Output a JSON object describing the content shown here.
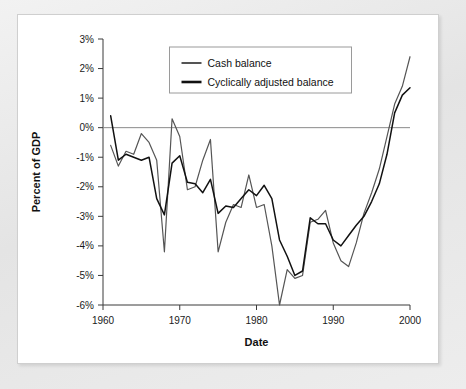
{
  "chart_data": {
    "type": "line",
    "title": "",
    "xlabel": "Date",
    "ylabel": "Percent of GDP",
    "xlim": [
      1960,
      2000
    ],
    "ylim": [
      -6,
      3
    ],
    "xticks": [
      1960,
      1970,
      1980,
      1990,
      2000
    ],
    "xtick_labels": [
      "1960",
      "1970",
      "1980",
      "1990",
      "2000"
    ],
    "yticks": [
      3,
      2,
      1,
      0,
      -1,
      -2,
      -3,
      -4,
      -5,
      -6
    ],
    "ytick_labels": [
      "3%",
      "2%",
      "1%",
      "0%",
      "-1%",
      "-2%",
      "-3%",
      "-4%",
      "-5%",
      "-6%"
    ],
    "grid": false,
    "zero_line": true,
    "legend_position": "top-center",
    "x": [
      1961,
      1962,
      1963,
      1964,
      1965,
      1966,
      1967,
      1968,
      1969,
      1970,
      1971,
      1972,
      1973,
      1974,
      1975,
      1976,
      1977,
      1978,
      1979,
      1980,
      1981,
      1982,
      1983,
      1984,
      1985,
      1986,
      1987,
      1988,
      1989,
      1990,
      1991,
      1992,
      1993,
      1994,
      1995,
      1996,
      1997,
      1998,
      1999,
      2000
    ],
    "series": [
      {
        "name": "Cash balance",
        "color": "#555555",
        "values": [
          -0.6,
          -1.3,
          -0.8,
          -0.9,
          -0.2,
          -0.5,
          -1.1,
          -4.2,
          0.3,
          -0.3,
          -2.1,
          -2.0,
          -1.1,
          -0.4,
          -4.2,
          -3.2,
          -2.6,
          -2.7,
          -1.6,
          -2.7,
          -2.6,
          -4.0,
          -6.0,
          -4.8,
          -5.1,
          -5.0,
          -3.2,
          -3.1,
          -2.8,
          -3.9,
          -4.5,
          -4.7,
          -3.9,
          -2.9,
          -2.2,
          -1.4,
          -0.3,
          0.8,
          1.4,
          2.4
        ]
      },
      {
        "name": "Cyclically adjusted balance",
        "color": "#111111",
        "values": [
          0.4,
          -1.1,
          -0.9,
          -1.0,
          -1.1,
          -1.0,
          -2.4,
          -2.95,
          -1.2,
          -0.95,
          -1.85,
          -1.9,
          -2.2,
          -1.75,
          -2.9,
          -2.65,
          -2.7,
          -2.4,
          -2.1,
          -2.3,
          -1.95,
          -2.4,
          -3.8,
          -4.35,
          -5.0,
          -4.85,
          -3.05,
          -3.25,
          -3.25,
          -3.8,
          -4.0,
          -3.65,
          -3.3,
          -3.0,
          -2.5,
          -1.9,
          -0.9,
          0.5,
          1.1,
          1.35
        ]
      }
    ]
  },
  "legend": {
    "items": [
      {
        "label": "Cash balance"
      },
      {
        "label": "Cyclically adjusted balance"
      }
    ]
  }
}
